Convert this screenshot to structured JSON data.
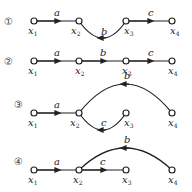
{
  "diagrams": [
    {
      "id": "1",
      "marker": "①",
      "nodes": [
        "x1",
        "x2",
        "x3",
        "x4"
      ],
      "edges": [
        {
          "from": "x1",
          "to": "x2",
          "label": "a"
        },
        {
          "from": "x3",
          "to": "x2",
          "label": "b"
        },
        {
          "from": "x3",
          "to": "x4",
          "label": "c"
        }
      ]
    },
    {
      "id": "2",
      "marker": "②",
      "nodes": [
        "x1",
        "x2",
        "x3",
        "x4"
      ],
      "edges": [
        {
          "from": "x1",
          "to": "x2",
          "label": "a"
        },
        {
          "from": "x2",
          "to": "x3",
          "label": "b"
        },
        {
          "from": "x3",
          "to": "x4",
          "label": "c"
        }
      ]
    },
    {
      "id": "3",
      "marker": "③",
      "nodes": [
        "x1",
        "x2",
        "x3",
        "x4"
      ],
      "edges": [
        {
          "from": "x1",
          "to": "x2",
          "label": "a"
        },
        {
          "from": "x4",
          "to": "x2",
          "label": "b"
        },
        {
          "from": "x3",
          "to": "x2",
          "label": "c"
        }
      ]
    },
    {
      "id": "4",
      "marker": "④",
      "nodes": [
        "x1",
        "x2",
        "x3",
        "x4"
      ],
      "edges": [
        {
          "from": "x1",
          "to": "x2",
          "label": "a"
        },
        {
          "from": "x4",
          "to": "x2",
          "label": "b"
        },
        {
          "from": "x2",
          "to": "x3",
          "label": "c"
        }
      ]
    }
  ],
  "labels": {
    "a": "a",
    "b": "b",
    "c": "c",
    "x": "x",
    "s1": "1",
    "s2": "2",
    "s3": "3",
    "s4": "4"
  }
}
